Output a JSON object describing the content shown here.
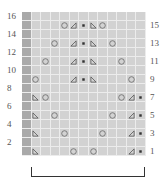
{
  "chart": {
    "title": "",
    "columns": 13,
    "rows": 16,
    "left_row_labels": [
      "16",
      "14",
      "12",
      "10",
      "8",
      "6",
      "4",
      "2"
    ],
    "right_row_labels": [
      "15",
      "13",
      "11",
      "9",
      "7",
      "5",
      "3",
      "1"
    ],
    "no_stitch_column": 1,
    "symbols": {
      "yo": "circle",
      "k2tog": "triangle-right-lean",
      "ssk": "triangle-left-lean",
      "purl": "dot"
    },
    "cells": {
      "1": {
        "1": "ns",
        "2": "ssk",
        "6": "yo",
        "8": "yo",
        "12": "k2tog",
        "13": "purl"
      },
      "3": {
        "1": "ns",
        "2": "ssk",
        "5": "yo",
        "9": "yo",
        "12": "k2tog",
        "13": "purl"
      },
      "5": {
        "1": "ns",
        "2": "ssk",
        "4": "yo",
        "10": "yo",
        "12": "k2tog",
        "13": "purl"
      },
      "7": {
        "1": "ns",
        "2": "ssk",
        "3": "yo",
        "11": "yo",
        "12": "k2tog",
        "13": "purl"
      },
      "9": {
        "1": "ns",
        "2": "yo",
        "6": "k2tog",
        "7": "purl",
        "8": "ssk",
        "12": "yo"
      },
      "11": {
        "1": "ns",
        "3": "yo",
        "6": "k2tog",
        "7": "purl",
        "8": "ssk",
        "11": "yo"
      },
      "13": {
        "1": "ns",
        "4": "yo",
        "6": "k2tog",
        "7": "purl",
        "8": "ssk",
        "10": "yo"
      },
      "15": {
        "1": "ns",
        "5": "yo",
        "6": "k2tog",
        "7": "purl",
        "8": "ssk",
        "9": "yo"
      }
    },
    "repeat_bracket": {
      "from_column": 2,
      "to_column": 13
    }
  },
  "colors": {
    "cell": "#d2d2d2",
    "no_stitch": "#a9a9a9",
    "gridline": "#ececec",
    "symbol": "#555555"
  }
}
